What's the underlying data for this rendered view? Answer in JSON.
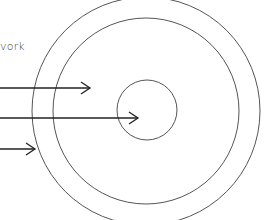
{
  "labels": {
    "network_fragment": "vork"
  },
  "colors": {
    "background": "#ffffff",
    "circle_stroke": "#555555",
    "arrow_stroke": "#222222",
    "text": "#444444"
  },
  "diagram": {
    "circles": [
      {
        "name": "outer-ring",
        "cx": 146,
        "cy": 111,
        "r": 114
      },
      {
        "name": "middle-ring",
        "cx": 146,
        "cy": 111,
        "r": 93
      },
      {
        "name": "inner-core",
        "cx": 147,
        "cy": 110,
        "r": 30
      }
    ],
    "arrows": [
      {
        "name": "arrow-to-middle-ring",
        "y": 88,
        "x_start": 0,
        "x_end": 90
      },
      {
        "name": "arrow-to-inner-core",
        "y": 118,
        "x_start": 0,
        "x_end": 138
      },
      {
        "name": "arrow-to-outer-ring",
        "y": 149,
        "x_start": 0,
        "x_end": 35
      }
    ]
  }
}
